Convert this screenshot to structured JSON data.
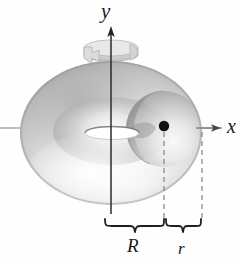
{
  "figure": {
    "kind": "torus-diagram",
    "caption_visible": false,
    "background_color": "#fefefe",
    "axes": {
      "y": {
        "label": "y",
        "icon": "y-axis-arrow-icon",
        "orientation": "vertical",
        "color": "#262626",
        "arrow_tip": {
          "x": 111,
          "y": 27
        },
        "origin": {
          "x": 111,
          "y": 128
        }
      },
      "x": {
        "label": "x",
        "icon": "x-axis-arrow-icon",
        "orientation": "horizontal",
        "color": "#6e6e6e",
        "arrow_tip": {
          "x": 221,
          "y": 128
        },
        "origin": {
          "x": 111,
          "y": 128
        }
      }
    },
    "rotation_arrow": {
      "icon": "rotation-ribbon-arrow-icon",
      "about_axis": "y",
      "color": "#d2d2d2",
      "stroke_color": "#a8a8a8"
    },
    "solid": {
      "name": "torus",
      "center": {
        "x": 111,
        "y": 133
      },
      "outer_radius_x": 91,
      "outer_radius_y": 72,
      "hole_radius_x": 26,
      "hole_radius_y": 6,
      "fill_light": "#fdfdfd",
      "fill_mid": "#d8d8d8",
      "fill_dark": "#8e8e8e"
    },
    "point": {
      "name": "generating-circle-center",
      "x": 164,
      "y": 126,
      "radius": 5,
      "color": "#111111"
    },
    "tube_circle": {
      "center": {
        "x": 164,
        "y": 129
      },
      "radius": 38,
      "stroke_color": "#9a9a9a"
    },
    "dashed_guides": [
      {
        "name": "dashed-guide-R",
        "x": 164,
        "y_top": 131,
        "y_bottom": 222,
        "color": "#8c8c8c"
      },
      {
        "name": "dashed-guide-r",
        "x": 202,
        "y_top": 131,
        "y_bottom": 222,
        "color": "#8c8c8c"
      }
    ],
    "braces": [
      {
        "name": "brace-R",
        "label": "R",
        "x_start": 105,
        "x_end": 164,
        "y": 224,
        "color": "#1f1f1f",
        "meaning": "distance from axis of revolution to center of the generating circle"
      },
      {
        "name": "brace-r",
        "label": "r",
        "x_start": 164,
        "x_end": 202,
        "y": 224,
        "color": "#1f1f1f",
        "meaning": "radius of the generating circle"
      }
    ]
  }
}
